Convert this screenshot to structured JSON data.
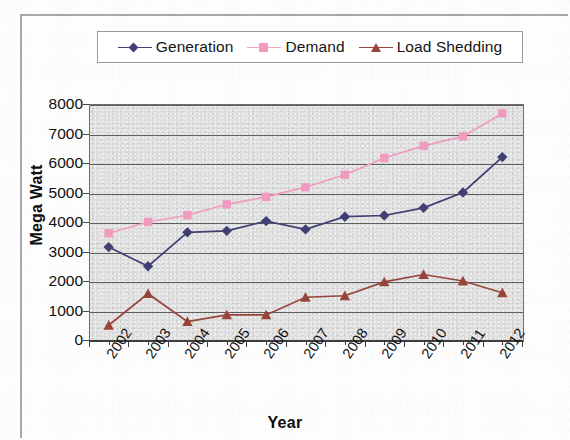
{
  "chart_data": {
    "type": "line",
    "title": "",
    "xlabel": "Year",
    "ylabel": "Mega Watt",
    "categories": [
      "2002",
      "2003",
      "2004",
      "2005",
      "2006",
      "2007",
      "2008",
      "2009",
      "2010",
      "2011",
      "2012"
    ],
    "ylim": [
      0,
      8000
    ],
    "y_ticks": [
      0,
      1000,
      2000,
      3000,
      4000,
      5000,
      6000,
      7000,
      8000
    ],
    "y_tick_labels": [
      "0",
      "1000",
      "2000",
      "3000",
      "4000",
      "5000",
      "6000",
      "7000",
      "8000"
    ],
    "grid": true,
    "legend_position": "top",
    "plot_background": "#dedede",
    "series": [
      {
        "name": "Generation",
        "marker": "diamond",
        "color": "#3f3f74",
        "values": [
          3150,
          2500,
          3650,
          3700,
          4030,
          3750,
          4180,
          4220,
          4480,
          5000,
          6200
        ]
      },
      {
        "name": "Demand",
        "marker": "square",
        "color": "#f09ac0",
        "values": [
          3620,
          4000,
          4230,
          4600,
          4850,
          5180,
          5600,
          6170,
          6580,
          6900,
          7680
        ]
      },
      {
        "name": "Load Shedding",
        "marker": "triangle",
        "color": "#97443a",
        "values": [
          500,
          1570,
          620,
          850,
          850,
          1450,
          1500,
          1970,
          2220,
          2000,
          1600
        ]
      }
    ]
  },
  "legend": {
    "entries": [
      {
        "label": "Generation"
      },
      {
        "label": "Demand"
      },
      {
        "label": "Load Shedding"
      }
    ]
  }
}
